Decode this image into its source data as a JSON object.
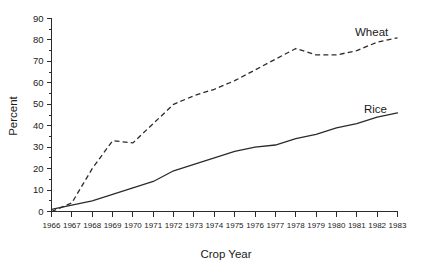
{
  "chart_data": {
    "type": "line",
    "title": "",
    "xlabel": "Crop Year",
    "ylabel": "Percent",
    "xlim": [
      1966,
      1983
    ],
    "ylim": [
      0,
      90
    ],
    "grid": false,
    "legend_position": "inline-end-of-line",
    "y_ticks_major": [
      0,
      10,
      20,
      30,
      40,
      50,
      60,
      70,
      80,
      90
    ],
    "y_ticks_minor": [
      5,
      15,
      25,
      35,
      45,
      55,
      65,
      75,
      85
    ],
    "x": [
      1966,
      1967,
      1968,
      1969,
      1970,
      1971,
      1972,
      1973,
      1974,
      1975,
      1976,
      1977,
      1978,
      1979,
      1980,
      1981,
      1982,
      1983
    ],
    "categories": [
      "1966",
      "1967",
      "1968",
      "1969",
      "1970",
      "1971",
      "1972",
      "1973",
      "1974",
      "1975",
      "1976",
      "1977",
      "1978",
      "1979",
      "1980",
      "1981",
      "1982",
      "1983"
    ],
    "series": [
      {
        "name": "Wheat",
        "style": "dashed",
        "color": "#2b2b2b",
        "values": [
          0,
          4,
          20,
          33,
          32,
          41,
          50,
          54,
          57,
          61,
          66,
          71,
          76,
          73,
          73,
          75,
          79,
          81
        ]
      },
      {
        "name": "Rice",
        "style": "solid",
        "color": "#2b2b2b",
        "values": [
          1,
          3,
          5,
          8,
          11,
          14,
          19,
          22,
          25,
          28,
          30,
          31,
          34,
          36,
          39,
          41,
          44,
          46
        ]
      }
    ]
  },
  "labels": {
    "wheat": "Wheat",
    "rice": "Rice",
    "y_axis_title": "Percent",
    "x_axis_title": "Crop Year"
  },
  "colors": {
    "ink": "#2b2b2b",
    "background": "#ffffff"
  }
}
